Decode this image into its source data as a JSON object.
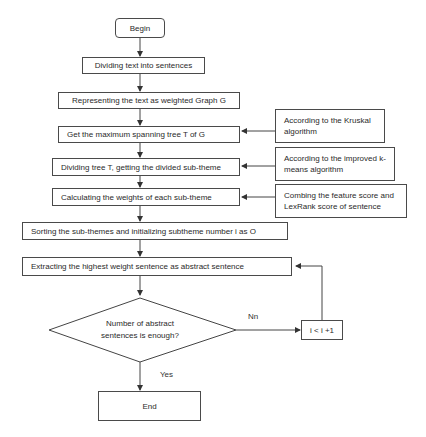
{
  "flowchart": {
    "begin": "Begin",
    "steps": [
      "Dividing text into sentences",
      "Representing the text as weighted Graph G",
      "Get the maximum spanning tree T of G",
      "Dividing tree T, getting the divided sub-theme",
      "Calculating the weights of each sub-theme",
      "Sorting the sub-themes and initializing subtheme number i as O",
      "Extracting the highest weight sentence as abstract sentence"
    ],
    "notes": [
      "According to the Kruskal algorithm",
      "According to the improved k-means algorithm",
      "Combing the feature score and LexRank score of sentence"
    ],
    "decision": "Number of abstract sentences is enough?",
    "no_label": "Nn",
    "yes_label": "Yes",
    "increment": "i < i +1",
    "end": "End"
  }
}
